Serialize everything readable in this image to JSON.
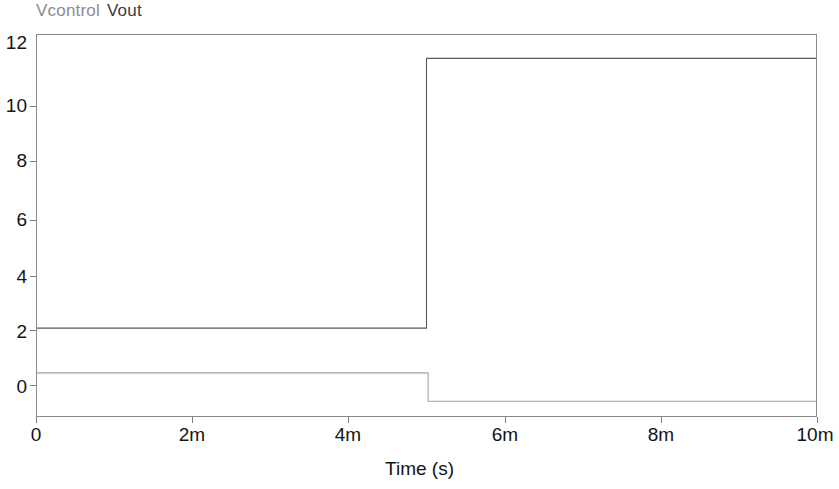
{
  "legend": {
    "entries": [
      {
        "label": "Vcontrol",
        "color": "#8c8c8c"
      },
      {
        "label": "Vout",
        "color": "#3c3c3c"
      }
    ]
  },
  "axes": {
    "x_title": "Time (s)",
    "y_title": "",
    "x_ticks": [
      "0",
      "2m",
      "4m",
      "6m",
      "8m",
      "10m"
    ],
    "y_ticks": [
      "0",
      "2",
      "4",
      "6",
      "8",
      "10",
      "12"
    ]
  },
  "chart_data": {
    "type": "line",
    "title": "",
    "subtitle": "",
    "xlabel": "Time (s)",
    "ylabel": "",
    "xlim": [
      0,
      0.01
    ],
    "ylim": [
      -0.6,
      12.4
    ],
    "x_tick_values": [
      0,
      0.002,
      0.004,
      0.006,
      0.008,
      0.01
    ],
    "x_tick_labels": [
      "0",
      "2m",
      "4m",
      "6m",
      "8m",
      "10m"
    ],
    "y_tick_values": [
      0,
      2,
      4,
      6,
      8,
      10,
      12
    ],
    "y_tick_labels": [
      "0",
      "2",
      "4",
      "6",
      "8",
      "10",
      "12"
    ],
    "grid": false,
    "legend_position": "above-left",
    "step_time_s": 0.005,
    "series": [
      {
        "name": "Vout",
        "color": "#3c3c3c",
        "style": "step",
        "low_value": 2.4,
        "high_value": 11.6,
        "x": [
          0,
          0.005,
          0.005,
          0.01
        ],
        "values": [
          2.4,
          2.4,
          11.6,
          11.6
        ]
      },
      {
        "name": "Vcontrol",
        "color": "#8c8c8c",
        "style": "step",
        "low_value": -0.1,
        "high_value": 0.87,
        "x": [
          0,
          0.00502,
          0.00502,
          0.01
        ],
        "values": [
          0.87,
          0.87,
          -0.1,
          -0.1
        ]
      }
    ]
  }
}
